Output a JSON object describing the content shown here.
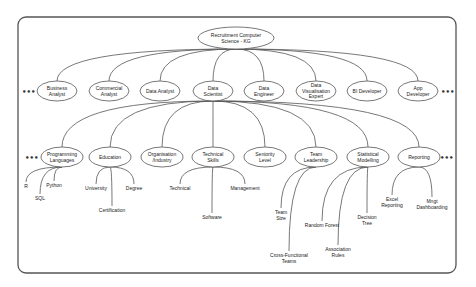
{
  "root": {
    "label": [
      "Recruitment Computer",
      "Science - KG"
    ],
    "x": 236,
    "y": 38,
    "rx": 38,
    "ry": 11
  },
  "roles": [
    {
      "label": [
        "Business",
        "Analyst"
      ],
      "x": 57,
      "y": 91
    },
    {
      "label": [
        "Commercial",
        "Analyst"
      ],
      "x": 109,
      "y": 91
    },
    {
      "label": [
        "Data Analyst"
      ],
      "x": 160,
      "y": 91
    },
    {
      "label": [
        "Data",
        "Scientist"
      ],
      "x": 213,
      "y": 91
    },
    {
      "label": [
        "Data",
        "Engineer"
      ],
      "x": 264,
      "y": 91
    },
    {
      "label": [
        "Data",
        "Visualisation",
        "Expert"
      ],
      "x": 316,
      "y": 91
    },
    {
      "label": [
        "BI Developer"
      ],
      "x": 367,
      "y": 91
    },
    {
      "label": [
        "App",
        "Developer"
      ],
      "x": 418,
      "y": 91
    }
  ],
  "attributes": [
    {
      "label": [
        "Programming",
        "Languages"
      ],
      "x": 62,
      "y": 157,
      "children": [
        {
          "label": [
            "R"
          ],
          "x": 26,
          "y": 186
        },
        {
          "label": [
            "Python"
          ],
          "x": 54,
          "y": 185
        },
        {
          "label": [
            "SQL"
          ],
          "x": 40,
          "y": 198
        }
      ]
    },
    {
      "label": [
        "Education"
      ],
      "x": 110,
      "y": 157,
      "children": [
        {
          "label": [
            "University"
          ],
          "x": 96,
          "y": 188
        },
        {
          "label": [
            "Degree"
          ],
          "x": 134,
          "y": 188
        },
        {
          "label": [
            "Certification"
          ],
          "x": 112,
          "y": 210
        }
      ]
    },
    {
      "label": [
        "Organisation",
        "/Industry"
      ],
      "x": 162,
      "y": 157,
      "children": []
    },
    {
      "label": [
        "Technical",
        "Skills"
      ],
      "x": 213,
      "y": 157,
      "children": [
        {
          "label": [
            "Technical"
          ],
          "x": 180,
          "y": 188
        },
        {
          "label": [
            "Management"
          ],
          "x": 245,
          "y": 188
        },
        {
          "label": [
            "Software"
          ],
          "x": 212,
          "y": 217
        }
      ]
    },
    {
      "label": [
        "Seniority",
        "Level"
      ],
      "x": 265,
      "y": 157,
      "children": []
    },
    {
      "label": [
        "Team",
        "Leadership"
      ],
      "x": 316,
      "y": 157,
      "children": [
        {
          "label": [
            "Team",
            "Size"
          ],
          "x": 281,
          "y": 215
        },
        {
          "label": [
            "Cross-Functional",
            "Teams"
          ],
          "x": 289,
          "y": 258
        }
      ]
    },
    {
      "label": [
        "Statistical",
        "Modelling"
      ],
      "x": 368,
      "y": 157,
      "children": [
        {
          "label": [
            "Random Forest"
          ],
          "x": 322,
          "y": 225
        },
        {
          "label": [
            "Association",
            "Rules"
          ],
          "x": 338,
          "y": 252
        },
        {
          "label": [
            "Decision",
            "Tree"
          ],
          "x": 367,
          "y": 220
        }
      ]
    },
    {
      "label": [
        "Reporting"
      ],
      "x": 419,
      "y": 157,
      "children": [
        {
          "label": [
            "Excel",
            "Reporting"
          ],
          "x": 392,
          "y": 202
        },
        {
          "label": [
            "Mngt",
            "Dashboarding"
          ],
          "x": 432,
          "y": 204
        }
      ]
    }
  ],
  "ellipsis": "•••",
  "frame": {
    "x": 18,
    "y": 17,
    "w": 438,
    "h": 256,
    "r": 8
  }
}
